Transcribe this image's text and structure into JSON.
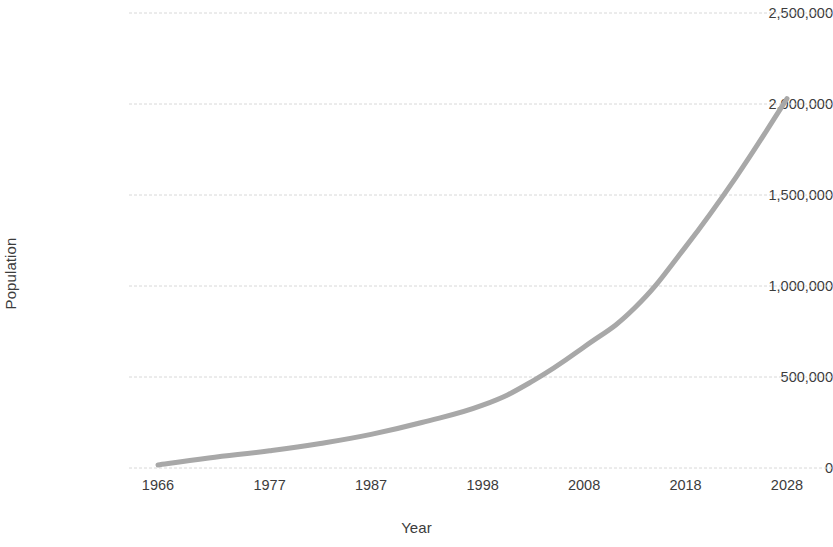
{
  "chart_data": {
    "type": "line",
    "title": "",
    "xlabel": "Year",
    "ylabel": "Population",
    "xlim": [
      1966,
      2028
    ],
    "ylim": [
      0,
      2500000
    ],
    "grid": true,
    "legend": false,
    "series_color": "#a8a8a8",
    "gridline_color": "#d8d8d8",
    "x_ticks": [
      "1966",
      "1977",
      "1987",
      "1998",
      "2008",
      "2018",
      "2028"
    ],
    "y_ticks": [
      "0",
      "500,000",
      "1,000,000",
      "1,500,000",
      "2,000,000",
      "2,500,000"
    ],
    "series": [
      {
        "name": "Population",
        "x": [
          1966,
          1971,
          1977,
          1982,
          1987,
          1992,
          1998,
          2003,
          2008,
          2013,
          2018,
          2023,
          2028
        ],
        "values": [
          17000,
          55000,
          95000,
          135000,
          185000,
          250000,
          345000,
          480000,
          665000,
          880000,
          1215000,
          1600000,
          2030000
        ]
      }
    ]
  },
  "axis_titles": {
    "x": "Year",
    "y": "Population"
  }
}
